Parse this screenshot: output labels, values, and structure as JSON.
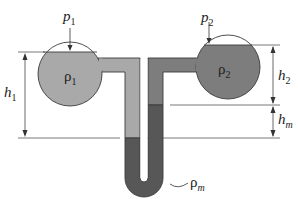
{
  "labels": {
    "p1": {
      "base": "p",
      "sub": "1"
    },
    "p2": {
      "base": "p",
      "sub": "2"
    },
    "rho1": {
      "base": "ρ",
      "sub": "1"
    },
    "rho2": {
      "base": "ρ",
      "sub": "2"
    },
    "rhom": {
      "base": "ρ",
      "sub": "m"
    },
    "h1": {
      "base": "h",
      "sub": "1"
    },
    "h2": {
      "base": "h",
      "sub": "2"
    },
    "hm": {
      "base": "h",
      "sub": "m"
    }
  },
  "colors": {
    "fluid1": "#a9a9a9",
    "fluid2": "#7d7d7d",
    "manometer_fluid": "#575757",
    "outline": "#3a3a3a",
    "dim_line": "#555555"
  }
}
